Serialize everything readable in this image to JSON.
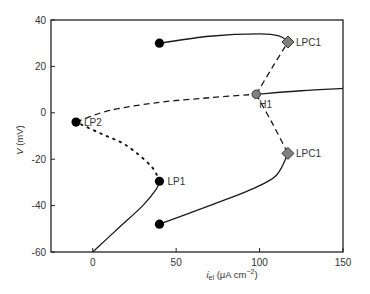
{
  "chart_data": {
    "type": "line",
    "title": "",
    "xlabel": "i_el (μA cm⁻²)",
    "xlabel_parts": {
      "main": "i",
      "sub": "el",
      "units_prefix": " (μA cm",
      "units_sup": "−2",
      "units_suffix": ")"
    },
    "ylabel": "V (mV)",
    "ylabel_parts": {
      "main": "V",
      "units": " (mV)"
    },
    "xlim": [
      -25,
      150
    ],
    "ylim": [
      -60,
      40
    ],
    "xticks": [
      0,
      50,
      100,
      150
    ],
    "yticks": [
      -60,
      -40,
      -20,
      0,
      20,
      40
    ],
    "grid": false,
    "legend": null,
    "series": [
      {
        "name": "stable rest branch (solid)",
        "style": "solid",
        "points": [
          [
            0,
            -60
          ],
          [
            15,
            -50
          ],
          [
            30,
            -40
          ],
          [
            38,
            -33
          ],
          [
            40,
            -29.5
          ]
        ]
      },
      {
        "name": "unstable middle branch (dotted)",
        "style": "dotted",
        "points": [
          [
            40,
            -29.5
          ],
          [
            35,
            -23
          ],
          [
            20,
            -14
          ],
          [
            5,
            -9
          ],
          [
            -10,
            -4
          ]
        ]
      },
      {
        "name": "unstable upper branch (dashed)",
        "style": "dashed",
        "points": [
          [
            -10,
            -4
          ],
          [
            10,
            1
          ],
          [
            40,
            4.5
          ],
          [
            70,
            6.5
          ],
          [
            98,
            8
          ]
        ]
      },
      {
        "name": "stable upper branch (solid)",
        "style": "solid",
        "points": [
          [
            98,
            8
          ],
          [
            125,
            9.5
          ],
          [
            150,
            10.5
          ]
        ]
      },
      {
        "name": "unstable limit cycle max (dashed)",
        "style": "dashed",
        "points": [
          [
            98,
            8
          ],
          [
            108,
            20
          ],
          [
            117,
            30.5
          ]
        ]
      },
      {
        "name": "unstable limit cycle min (dashed)",
        "style": "dashed",
        "points": [
          [
            98,
            8
          ],
          [
            108,
            -5
          ],
          [
            117,
            -17.5
          ]
        ]
      },
      {
        "name": "stable limit cycle max (solid)",
        "style": "solid",
        "points": [
          [
            40,
            30
          ],
          [
            70,
            33
          ],
          [
            100,
            34
          ],
          [
            112,
            33
          ],
          [
            117,
            30.5
          ]
        ]
      },
      {
        "name": "stable limit cycle min (solid)",
        "style": "solid",
        "points": [
          [
            40,
            -48
          ],
          [
            70,
            -40
          ],
          [
            95,
            -33
          ],
          [
            110,
            -27
          ],
          [
            117,
            -17.5
          ]
        ]
      }
    ],
    "special_points": [
      {
        "label": "LP1",
        "x": 40,
        "y": -29.5,
        "marker": "circle",
        "color": "#000000"
      },
      {
        "label": "LP2",
        "x": -10,
        "y": -4,
        "marker": "circle",
        "color": "#000000"
      },
      {
        "label": "H1",
        "x": 98,
        "y": 8,
        "marker": "circle",
        "color": "#808080"
      },
      {
        "label": "LPC1",
        "x": 117,
        "y": 30.5,
        "marker": "diamond",
        "color": "#808080"
      },
      {
        "label": "LPC1",
        "x": 117,
        "y": -17.5,
        "marker": "diamond",
        "color": "#808080"
      },
      {
        "label": "",
        "x": 40,
        "y": 30,
        "marker": "circle",
        "color": "#000000"
      },
      {
        "label": "",
        "x": 40,
        "y": -48,
        "marker": "circle",
        "color": "#000000"
      }
    ]
  }
}
